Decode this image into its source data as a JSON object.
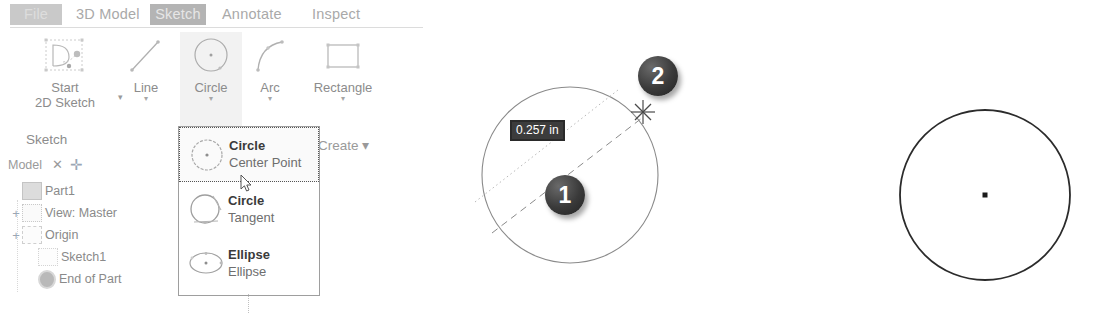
{
  "ribbon": {
    "tabs": [
      {
        "id": "file",
        "label": "File"
      },
      {
        "id": "3d-model",
        "label": "3D Model"
      },
      {
        "id": "sketch",
        "label": "Sketch"
      },
      {
        "id": "annotate",
        "label": "Annotate"
      },
      {
        "id": "inspect",
        "label": "Inspect"
      }
    ],
    "active_tab": "Sketch",
    "buttons": [
      {
        "id": "start-2d-sketch",
        "line1": "Start",
        "line2": "2D Sketch",
        "icon": "sketch-plane-icon",
        "caret": "▾"
      },
      {
        "id": "line",
        "line1": "Line",
        "line2": "",
        "icon": "line-icon",
        "caret": "▾"
      },
      {
        "id": "circle",
        "line1": "Circle",
        "line2": "",
        "icon": "circle-icon",
        "caret": "▾"
      },
      {
        "id": "arc",
        "line1": "Arc",
        "line2": "",
        "icon": "arc-icon",
        "caret": "▾"
      },
      {
        "id": "rectangle",
        "line1": "Rectangle",
        "line2": "",
        "icon": "rectangle-icon",
        "caret": "▾"
      }
    ],
    "panels": {
      "sketch_label": "Sketch",
      "create_label": "Create",
      "create_caret": "▾"
    }
  },
  "browser": {
    "tab_label": "Model",
    "close_glyph": "✕",
    "add_glyph": "✛",
    "tree": [
      {
        "label": "Part1",
        "expander": "",
        "icon": "part-icon",
        "indent": 0
      },
      {
        "label": "View: Master",
        "expander": "+",
        "icon": "view-icon",
        "indent": 1
      },
      {
        "label": "Origin",
        "expander": "+",
        "icon": "origin-folder-icon",
        "indent": 1
      },
      {
        "label": "Sketch1",
        "expander": "",
        "icon": "sketch-icon",
        "indent": 2
      },
      {
        "label": "End of Part",
        "expander": "",
        "icon": "end-of-part-icon",
        "indent": 2
      }
    ]
  },
  "dropdown": {
    "items": [
      {
        "title": "Circle",
        "subtitle": "Center Point",
        "icon": "circle-center-point-icon",
        "selected": true
      },
      {
        "title": "Circle",
        "subtitle": "Tangent",
        "icon": "circle-tangent-icon",
        "selected": false
      },
      {
        "title": "Ellipse",
        "subtitle": "Ellipse",
        "icon": "ellipse-icon",
        "selected": false
      }
    ],
    "cursor": "arrow-cursor"
  },
  "diagram_middle": {
    "dimension_value": "0.257 in",
    "badges": [
      {
        "number": "1",
        "meaning": "click-center-point"
      },
      {
        "number": "2",
        "meaning": "drag-to-radius"
      }
    ],
    "cursor": "crosshair-cursor"
  },
  "diagram_right": {
    "center_point": "center-point-marker"
  },
  "colors": {
    "tab_inactive_text": "#a9a9a9",
    "tab_active_background": "#b4b4b4",
    "file_tab_background": "#c9c9c9",
    "ribbon_label_text": "#8c8c8c",
    "dropdown_border": "#9e9e9e",
    "dropdown_title_text": "#3a3a3a",
    "dropdown_subtitle_text": "#6e6e6e",
    "badge_fill": "#333333",
    "dimension_box_fill": "#3c3c3c",
    "dimension_box_text": "#ffffff",
    "sketch_geometry_stroke": "#8a8a8a",
    "final_circle_stroke": "#2b2b2b"
  }
}
